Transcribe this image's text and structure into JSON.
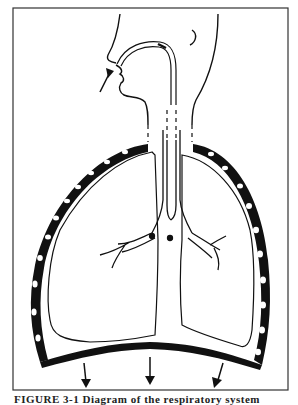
{
  "figure": {
    "caption_partial": "FIGURE 3-1 Diagram of the respiratory system",
    "colors": {
      "ink": "#111111",
      "background": "#ffffff"
    },
    "arrows": {
      "inhale_arrow_count": 1,
      "diaphragm_arrow_count": 3,
      "diaphragm_arrow_direction": "down"
    }
  }
}
